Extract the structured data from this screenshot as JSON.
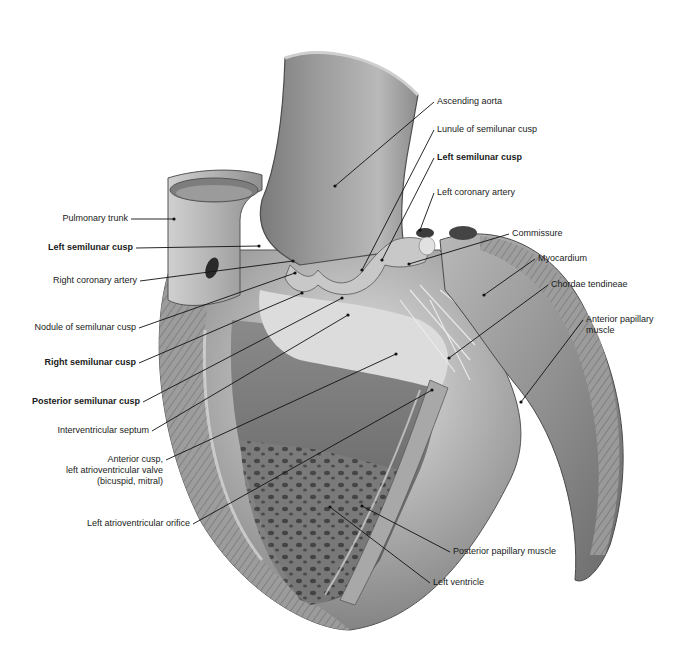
{
  "diagram": {
    "colors": {
      "background": "#ffffff",
      "label_text": "#1a1a1a",
      "leader_line": "#111111"
    },
    "labels_left": [
      {
        "id": "pulmonary-trunk",
        "text": "Pulmonary trunk",
        "bold": false,
        "x": 128,
        "y": 219,
        "anchor": "right",
        "pt": [
          174,
          219
        ]
      },
      {
        "id": "left-semilunar-cusp-pulm",
        "text": "Left semilunar cusp",
        "bold": true,
        "x": 133,
        "y": 248,
        "anchor": "right",
        "pt": [
          259,
          246
        ]
      },
      {
        "id": "right-coronary-artery",
        "text": "Right coronary artery",
        "bold": false,
        "x": 137,
        "y": 281,
        "anchor": "right",
        "pt": [
          293,
          261
        ]
      },
      {
        "id": "nodule-of-semilunar-cusp",
        "text": "Nodule of semilunar cusp",
        "bold": false,
        "x": 136,
        "y": 328,
        "anchor": "right",
        "pt": [
          295,
          273
        ]
      },
      {
        "id": "right-semilunar-cusp",
        "text": "Right semilunar cusp",
        "bold": true,
        "x": 136,
        "y": 363,
        "anchor": "right",
        "pt": [
          302,
          293
        ]
      },
      {
        "id": "posterior-semilunar-cusp",
        "text": "Posterior semilunar cusp",
        "bold": true,
        "x": 140,
        "y": 402,
        "anchor": "right",
        "pt": [
          342,
          298
        ]
      },
      {
        "id": "interventricular-septum",
        "text": "Interventricular septum",
        "bold": false,
        "x": 149,
        "y": 431,
        "anchor": "right",
        "pt": [
          348,
          315
        ]
      },
      {
        "id": "anterior-cusp-mitral",
        "text": "Anterior cusp,\nleft atrioventricular valve\n(bicuspid, mitral)",
        "bold": false,
        "x": 163,
        "y": 460,
        "anchor": "right",
        "pt": [
          396,
          354
        ]
      },
      {
        "id": "left-atrioventricular-orifice",
        "text": "Left atrioventricular orifice",
        "bold": false,
        "x": 190,
        "y": 524,
        "anchor": "right",
        "pt": [
          432,
          390
        ]
      }
    ],
    "labels_right": [
      {
        "id": "ascending-aorta",
        "text": "Ascending aorta",
        "bold": false,
        "x": 437,
        "y": 102,
        "anchor": "left",
        "pt": [
          335,
          186
        ]
      },
      {
        "id": "lunule-of-semilunar-cusp",
        "text": "Lunule of semilunar cusp",
        "bold": false,
        "x": 437,
        "y": 130,
        "anchor": "left",
        "pt": [
          362,
          270
        ]
      },
      {
        "id": "left-semilunar-cusp-aortic",
        "text": "Left semilunar cusp",
        "bold": true,
        "x": 437,
        "y": 158,
        "anchor": "left",
        "pt": [
          382,
          260
        ]
      },
      {
        "id": "left-coronary-artery",
        "text": "Left coronary artery",
        "bold": false,
        "x": 437,
        "y": 193,
        "anchor": "left",
        "pt": [
          420,
          230
        ]
      },
      {
        "id": "commissure",
        "text": "Commissure",
        "bold": false,
        "x": 512,
        "y": 234,
        "anchor": "left",
        "pt": [
          409,
          264
        ]
      },
      {
        "id": "myocardium",
        "text": "Myocardium",
        "bold": false,
        "x": 538,
        "y": 259,
        "anchor": "left",
        "pt": [
          484,
          295
        ]
      },
      {
        "id": "chordae-tendineae",
        "text": "Chordae tendineae",
        "bold": false,
        "x": 551,
        "y": 285,
        "anchor": "left",
        "pt": [
          449,
          358
        ]
      },
      {
        "id": "anterior-papillary-muscle",
        "text": "Anterior papillary\nmuscle",
        "bold": false,
        "x": 586,
        "y": 320,
        "anchor": "left",
        "pt": [
          521,
          402
        ]
      },
      {
        "id": "posterior-papillary-muscle",
        "text": "Posterior papillary muscle",
        "bold": false,
        "x": 453,
        "y": 552,
        "anchor": "left",
        "pt": [
          362,
          506
        ]
      },
      {
        "id": "left-ventricle",
        "text": "Left ventricle",
        "bold": false,
        "x": 433,
        "y": 583,
        "anchor": "left",
        "pt": [
          330,
          507
        ]
      }
    ]
  }
}
